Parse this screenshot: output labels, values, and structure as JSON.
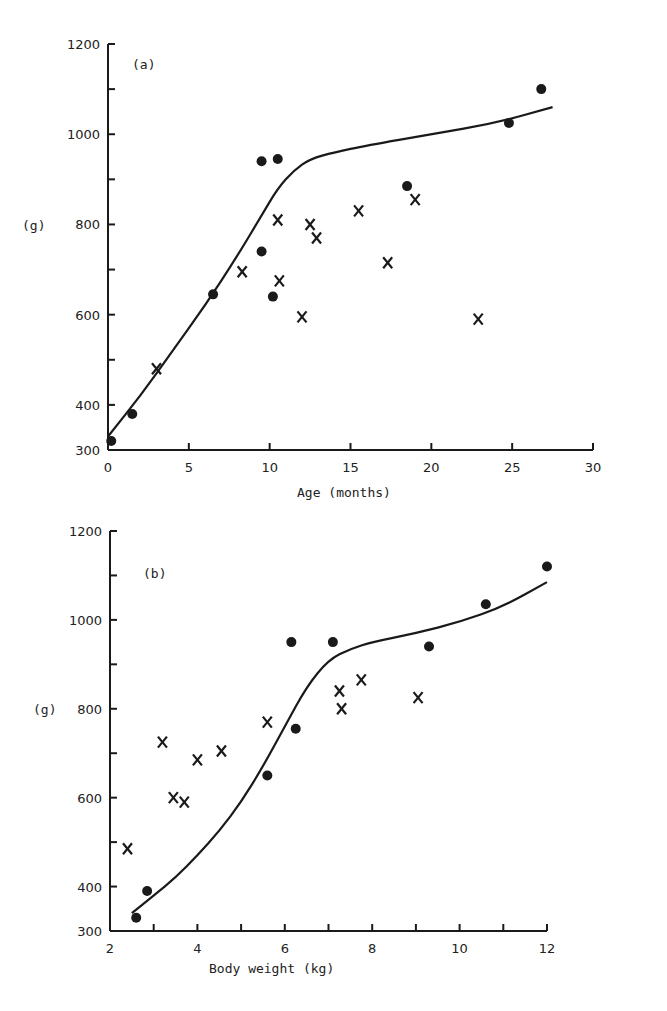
{
  "chart_data": [
    {
      "type": "scatter",
      "panel_label": "(a)",
      "title": "",
      "xlabel": "Age (months)",
      "ylabel": "(g)",
      "xlim": [
        0,
        30
      ],
      "ylim": [
        300,
        1200
      ],
      "x_ticks": [
        0,
        5,
        10,
        15,
        20,
        25,
        30
      ],
      "y_ticks_labeled": [
        300,
        400,
        600,
        800,
        1000,
        1200
      ],
      "y_ticks_minor": [
        500,
        700,
        900,
        1100
      ],
      "grid": false,
      "series": [
        {
          "name": "dots",
          "marker": "filled-circle",
          "points": [
            [
              0.2,
              320
            ],
            [
              1.5,
              380
            ],
            [
              6.5,
              645
            ],
            [
              9.5,
              940
            ],
            [
              10.5,
              945
            ],
            [
              9.5,
              740
            ],
            [
              10.2,
              640
            ],
            [
              18.5,
              885
            ],
            [
              24.8,
              1025
            ],
            [
              26.8,
              1100
            ]
          ]
        },
        {
          "name": "crosses",
          "marker": "x",
          "points": [
            [
              3,
              480
            ],
            [
              8.3,
              695
            ],
            [
              10.5,
              810
            ],
            [
              10.6,
              675
            ],
            [
              12,
              595
            ],
            [
              12.5,
              800
            ],
            [
              12.9,
              770
            ],
            [
              15.5,
              830
            ],
            [
              17.3,
              715
            ],
            [
              19,
              855
            ],
            [
              22.9,
              590
            ]
          ]
        },
        {
          "name": "fitted curve",
          "marker": "line",
          "points": [
            [
              0,
              330
            ],
            [
              2,
              420
            ],
            [
              4,
              520
            ],
            [
              6,
              620
            ],
            [
              8,
              730
            ],
            [
              9.5,
              820
            ],
            [
              10.5,
              880
            ],
            [
              11.5,
              920
            ],
            [
              12.5,
              945
            ],
            [
              14,
              960
            ],
            [
              16,
              975
            ],
            [
              20,
              1000
            ],
            [
              24,
              1025
            ],
            [
              27.5,
              1060
            ]
          ]
        }
      ]
    },
    {
      "type": "scatter",
      "panel_label": "(b)",
      "title": "",
      "xlabel": "Body weight (kg)",
      "ylabel": "(g)",
      "xlim": [
        2,
        12
      ],
      "ylim": [
        300,
        1200
      ],
      "x_ticks": [
        2,
        4,
        6,
        8,
        10,
        12
      ],
      "x_ticks_minor": [
        3,
        5,
        7,
        9,
        11
      ],
      "y_ticks_labeled": [
        300,
        400,
        600,
        800,
        1000,
        1200
      ],
      "y_ticks_minor": [
        500,
        700,
        900,
        1100
      ],
      "grid": false,
      "series": [
        {
          "name": "dots",
          "marker": "filled-circle",
          "points": [
            [
              2.6,
              330
            ],
            [
              2.85,
              390
            ],
            [
              5.6,
              650
            ],
            [
              6.15,
              950
            ],
            [
              6.25,
              755
            ],
            [
              7.1,
              950
            ],
            [
              9.3,
              940
            ],
            [
              10.6,
              1035
            ],
            [
              12,
              1120
            ]
          ]
        },
        {
          "name": "crosses",
          "marker": "x",
          "points": [
            [
              2.4,
              485
            ],
            [
              3.2,
              725
            ],
            [
              3.45,
              600
            ],
            [
              3.7,
              590
            ],
            [
              4.0,
              685
            ],
            [
              4.55,
              705
            ],
            [
              5.6,
              770
            ],
            [
              7.25,
              840
            ],
            [
              7.3,
              800
            ],
            [
              7.75,
              865
            ],
            [
              9.05,
              825
            ]
          ]
        },
        {
          "name": "fitted curve",
          "marker": "line",
          "points": [
            [
              2.5,
              340
            ],
            [
              3,
              380
            ],
            [
              3.5,
              420
            ],
            [
              4,
              470
            ],
            [
              4.5,
              525
            ],
            [
              5,
              590
            ],
            [
              5.5,
              670
            ],
            [
              6,
              760
            ],
            [
              6.5,
              850
            ],
            [
              7,
              910
            ],
            [
              7.5,
              935
            ],
            [
              8,
              950
            ],
            [
              9,
              970
            ],
            [
              10,
              995
            ],
            [
              11,
              1030
            ],
            [
              12,
              1085
            ]
          ]
        }
      ]
    }
  ],
  "labels": {
    "a": {
      "panel": "(a)",
      "ylabel": "(g)",
      "xlabel": "Age (months)",
      "x_tick_labels": [
        "0",
        "5",
        "10",
        "15",
        "20",
        "25",
        "30"
      ],
      "y_tick_labels": [
        "1200",
        "1000",
        "800",
        "600",
        "400",
        "300"
      ]
    },
    "b": {
      "panel": "(b)",
      "ylabel": "(g)",
      "xlabel": "Body weight (kg)",
      "x_tick_labels": [
        "2",
        "4",
        "6",
        "8",
        "10",
        "12"
      ],
      "y_tick_labels": [
        "1200",
        "1000",
        "800",
        "600",
        "400",
        "300"
      ]
    }
  }
}
